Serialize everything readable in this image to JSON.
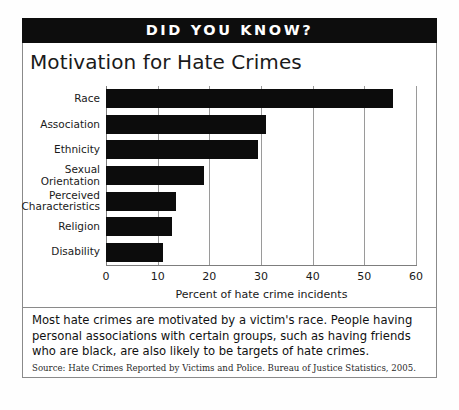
{
  "banner": {
    "label": "DID YOU KNOW?"
  },
  "caption": {
    "body": "Most hate crimes are motivated by a victim's race. People having personal associations with certain groups, such as having friends who are black, are also likely to be targets of hate crimes.",
    "source": "Source: Hate Crimes Reported by Victims and Police. Bureau of Justice Statistics, 2005."
  },
  "colors": {
    "bar": "#0c0c0c",
    "banner_bg": "#0d0d0d",
    "banner_text": "#ffffff",
    "grid": "#9a9a9a",
    "axis": "#7d7d7d",
    "border": "#8a8a8a",
    "text": "#1a1a1a"
  },
  "chart_data": {
    "type": "bar",
    "orientation": "horizontal",
    "title": "Motivation for Hate Crimes",
    "xlabel": "Percent of hate crime incidents",
    "ylabel": "",
    "categories": [
      "Race",
      "Association",
      "Ethnicity",
      "Sexual Orientation",
      "Ethnicity",
      "Religion",
      "Disability"
    ],
    "category_labels": [
      "Race",
      "Association",
      "Ethnicity",
      "Sexual\nOrientation",
      "Perceived\nCharacteristics",
      "Religion",
      "Disability"
    ],
    "values": [
      55.5,
      31.0,
      29.5,
      19.0,
      13.5,
      12.8,
      11.0
    ],
    "xlim": [
      0,
      60
    ],
    "xticks": [
      0,
      10,
      20,
      30,
      40,
      50,
      60
    ],
    "xticklabels": [
      "0",
      "10",
      "20",
      "30",
      "40",
      "50",
      "60"
    ],
    "grid": true,
    "grid_axis": "x",
    "legend": false
  }
}
